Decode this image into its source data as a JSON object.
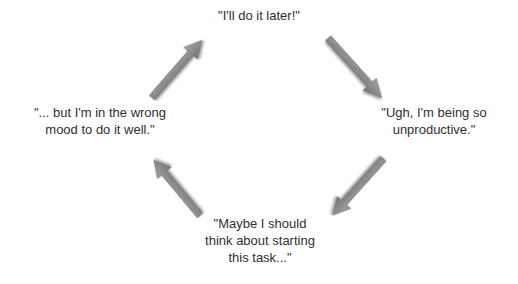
{
  "diagram": {
    "type": "cycle",
    "nodes": [
      {
        "id": "top",
        "lines": [
          "\"I'll do it later!\""
        ]
      },
      {
        "id": "right",
        "lines": [
          "\"Ugh, I'm being so",
          "unproductive.\""
        ]
      },
      {
        "id": "bottom",
        "lines": [
          "\"Maybe I should",
          "think about starting",
          "this task...\""
        ]
      },
      {
        "id": "left",
        "lines": [
          "\"... but I'm in the wrong",
          "mood to do it well.\""
        ]
      }
    ],
    "edges": [
      {
        "from": "top",
        "to": "right"
      },
      {
        "from": "right",
        "to": "bottom"
      },
      {
        "from": "bottom",
        "to": "left"
      },
      {
        "from": "left",
        "to": "top"
      }
    ],
    "colors": {
      "arrow_fill": "#8a8a8a",
      "arrow_stroke": "#6a6a6a",
      "text": "#2f2f2f",
      "background": "#ffffff"
    }
  }
}
